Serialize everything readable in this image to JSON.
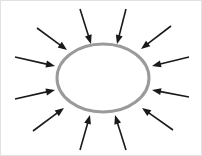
{
  "figure": {
    "type": "diagram",
    "canvas": {
      "width": 202,
      "height": 156,
      "background": "#ffffff"
    },
    "border": {
      "visible": true,
      "color": "#e2e2e2",
      "width": 1
    }
  },
  "ellipse": {
    "label": "central-ellipse",
    "cx": 103,
    "cy": 78,
    "rx": 46,
    "ry": 34,
    "stroke": "#9a9a9a",
    "stroke_width": 3,
    "fill": "#ffffff"
  },
  "arrows": {
    "count": 12,
    "color": "#1a1a1a",
    "shaft_width": 1.6,
    "head_length": 9,
    "head_width": 7,
    "direction": "inward",
    "items": [
      {
        "name": "arrow-north-left",
        "bearing_deg": 255,
        "tail_x": 80,
        "tail_y": 9,
        "tip_x": 91,
        "tip_y": 44
      },
      {
        "name": "arrow-north-right",
        "bearing_deg": 285,
        "tail_x": 126,
        "tail_y": 9,
        "tip_x": 117,
        "tip_y": 44
      },
      {
        "name": "arrow-northwest-upper",
        "bearing_deg": 225,
        "tail_x": 37,
        "tail_y": 28,
        "tip_x": 67,
        "tip_y": 50
      },
      {
        "name": "arrow-northeast-upper",
        "bearing_deg": 315,
        "tail_x": 171,
        "tail_y": 26,
        "tip_x": 141,
        "tip_y": 49
      },
      {
        "name": "arrow-west-upper",
        "bearing_deg": 190,
        "tail_x": 15,
        "tail_y": 57,
        "tip_x": 55,
        "tip_y": 66
      },
      {
        "name": "arrow-west-lower",
        "bearing_deg": 170,
        "tail_x": 15,
        "tail_y": 99,
        "tip_x": 55,
        "tip_y": 90
      },
      {
        "name": "arrow-east-upper",
        "bearing_deg": 350,
        "tail_x": 189,
        "tail_y": 57,
        "tip_x": 152,
        "tip_y": 66
      },
      {
        "name": "arrow-east-lower",
        "bearing_deg": 10,
        "tail_x": 189,
        "tail_y": 97,
        "tip_x": 152,
        "tip_y": 90
      },
      {
        "name": "arrow-southwest-lower",
        "bearing_deg": 135,
        "tail_x": 33,
        "tail_y": 131,
        "tip_x": 64,
        "tip_y": 108
      },
      {
        "name": "arrow-south-left",
        "bearing_deg": 105,
        "tail_x": 80,
        "tail_y": 150,
        "tip_x": 90,
        "tip_y": 115
      },
      {
        "name": "arrow-south-right",
        "bearing_deg": 75,
        "tail_x": 126,
        "tail_y": 150,
        "tip_x": 115,
        "tip_y": 115
      },
      {
        "name": "arrow-southeast-lower",
        "bearing_deg": 45,
        "tail_x": 173,
        "tail_y": 130,
        "tip_x": 142,
        "tip_y": 108
      }
    ]
  }
}
